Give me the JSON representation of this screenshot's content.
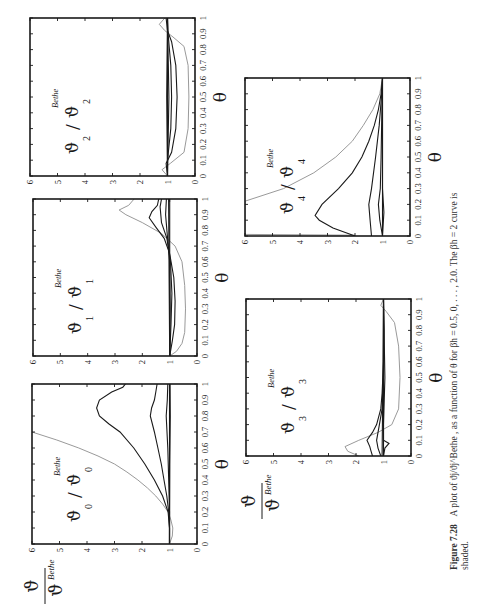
{
  "figure": {
    "number_label": "Figure 7.28",
    "caption_text": "A plot of ϑj/ϑj^Bethe , as a function of θ for βh = 0.5, 0, . . . , 2.0. The βh = 2 curve is",
    "caption_line2": "shaded.",
    "rotation": "page rotated 90° counter-clockwise",
    "shared_ylabel_numerator": "ϑ",
    "shared_ylabel_denominator": "ϑ",
    "shared_ylabel_sup": "Bethe"
  },
  "chart_data": [
    {
      "type": "line",
      "id": "plot0",
      "title": "ϑ0/ϑ0^Bethe",
      "inset_label": {
        "main": "ϑ",
        "sub": "0",
        "slash": "/",
        "main2": "ϑ",
        "sub2": "0",
        "sup": "Bethe"
      },
      "xlabel": "θ",
      "ylabel": "ϑ/ϑ^Bethe",
      "xlim": [
        0,
        1
      ],
      "ylim": [
        0,
        6
      ],
      "xticks": [
        "0",
        "0.1",
        "0.2",
        "0.3",
        "0.4",
        "0.5",
        "0.6",
        "0.7",
        "0.8",
        "0.9",
        "1"
      ],
      "yticks": [
        "0",
        "1",
        "2",
        "3",
        "4",
        "5",
        "6"
      ],
      "frame_px": {
        "x0": 32,
        "x1": 197,
        "y0": 384,
        "y1": 544
      },
      "series": [
        {
          "name": "βh=2.0 (shaded)",
          "shaded": true,
          "x": [
            0,
            0.05,
            0.1,
            0.15,
            0.2,
            0.25,
            0.3,
            0.35,
            0.4,
            0.45,
            0.5,
            0.55,
            0.6,
            0.65,
            0.7
          ],
          "values": [
            1.0,
            0.9,
            0.88,
            0.95,
            1.05,
            1.25,
            1.5,
            1.8,
            2.15,
            2.55,
            3.0,
            3.6,
            4.3,
            5.1,
            6.0
          ]
        },
        {
          "name": "βh=1.5",
          "x": [
            0,
            0.1,
            0.2,
            0.3,
            0.4,
            0.5,
            0.6,
            0.7,
            0.75,
            0.8,
            0.85,
            0.9,
            0.95,
            0.98,
            1.0
          ],
          "values": [
            1.0,
            1.0,
            1.05,
            1.25,
            1.55,
            1.9,
            2.3,
            2.8,
            3.2,
            3.55,
            3.65,
            3.55,
            3.1,
            2.7,
            2.6
          ]
        },
        {
          "name": "βh=1.0",
          "x": [
            0,
            0.1,
            0.2,
            0.3,
            0.4,
            0.5,
            0.6,
            0.7,
            0.8,
            0.85,
            0.9,
            0.95,
            1.0
          ],
          "values": [
            1.0,
            1.0,
            1.03,
            1.1,
            1.2,
            1.3,
            1.42,
            1.55,
            1.7,
            1.65,
            1.55,
            1.5,
            1.45
          ]
        },
        {
          "name": "βh=0.5",
          "x": [
            0,
            0.2,
            0.4,
            0.6,
            0.8,
            0.9,
            1.0
          ],
          "values": [
            1.0,
            1.0,
            1.03,
            1.06,
            1.12,
            1.08,
            1.06
          ]
        },
        {
          "name": "βh=0",
          "x": [
            0,
            0.5,
            1.0
          ],
          "values": [
            1.0,
            1.0,
            1.0
          ]
        },
        {
          "name": "βh=-0.5",
          "x": [
            0,
            0.5,
            0.8,
            1.0
          ],
          "values": [
            1.0,
            0.99,
            0.97,
            0.98
          ]
        }
      ]
    },
    {
      "type": "line",
      "id": "plot1",
      "title": "ϑ1/ϑ1^Bethe",
      "inset_label": {
        "main": "ϑ",
        "sub": "1",
        "slash": "/",
        "main2": "ϑ",
        "sub2": "1",
        "sup": "Bethe"
      },
      "xlabel": "θ",
      "xlim": [
        0,
        1
      ],
      "ylim": [
        0,
        6
      ],
      "xticks": [
        "0",
        "0.1",
        "0.2",
        "0.3",
        "0.4",
        "0.5",
        "0.6",
        "0.7",
        "0.8",
        "0.9",
        "1"
      ],
      "yticks": [
        "0",
        "1",
        "2",
        "3",
        "4",
        "5",
        "6"
      ],
      "frame_px": {
        "x0": 33,
        "x1": 197,
        "y0": 199,
        "y1": 356
      },
      "series": [
        {
          "name": "βh=2.0 (shaded)",
          "shaded": true,
          "x": [
            0,
            0.03,
            0.08,
            0.15,
            0.3,
            0.45,
            0.6,
            0.7,
            0.78,
            0.85,
            0.9,
            0.93,
            0.96,
            1.0
          ],
          "values": [
            1.0,
            0.75,
            0.55,
            0.45,
            0.42,
            0.45,
            0.55,
            0.8,
            1.3,
            2.0,
            2.6,
            2.85,
            2.5,
            2.3
          ]
        },
        {
          "name": "βh=1.5",
          "x": [
            0,
            0.1,
            0.2,
            0.35,
            0.5,
            0.65,
            0.75,
            0.82,
            0.88,
            0.92,
            0.96,
            1.0
          ],
          "values": [
            1.0,
            0.9,
            0.82,
            0.8,
            0.85,
            1.0,
            1.2,
            1.5,
            1.75,
            1.65,
            1.45,
            1.4
          ]
        },
        {
          "name": "βh=1.0",
          "x": [
            0,
            0.2,
            0.4,
            0.6,
            0.75,
            0.85,
            0.95,
            1.0
          ],
          "values": [
            1.0,
            0.95,
            0.92,
            0.97,
            1.1,
            1.3,
            1.35,
            1.3
          ]
        },
        {
          "name": "βh=0.5",
          "x": [
            0,
            0.3,
            0.6,
            0.8,
            0.9,
            1.0
          ],
          "values": [
            1.0,
            0.98,
            1.0,
            1.1,
            1.15,
            1.12
          ]
        },
        {
          "name": "βh=0",
          "x": [
            0,
            0.5,
            1.0
          ],
          "values": [
            1.0,
            1.0,
            1.0
          ]
        },
        {
          "name": "βh=-0.5",
          "x": [
            0,
            0.5,
            1.0
          ],
          "values": [
            1.0,
            1.02,
            1.04
          ]
        }
      ]
    },
    {
      "type": "line",
      "id": "plot2",
      "title": "ϑ2/ϑ2^Bethe",
      "inset_label": {
        "main": "ϑ",
        "sub": "2",
        "slash": "/",
        "main2": "ϑ",
        "sub2": "2",
        "sup": "Bethe"
      },
      "xlabel": "θ",
      "xlim": [
        0,
        1
      ],
      "ylim": [
        0,
        6
      ],
      "xticks": [
        "0",
        "0.1",
        "0.2",
        "0.3",
        "0.4",
        "0.5",
        "0.6",
        "0.7",
        "0.8",
        "0.9",
        "1"
      ],
      "yticks": [
        "0",
        "1",
        "2",
        "3",
        "4",
        "5",
        "6"
      ],
      "frame_px": {
        "x0": 30,
        "x1": 195,
        "y0": 18,
        "y1": 176
      },
      "series": [
        {
          "name": "βh=2.0 (shaded)",
          "shaded": true,
          "x": [
            0,
            0.04,
            0.08,
            0.15,
            0.3,
            0.5,
            0.7,
            0.82,
            0.88,
            0.92,
            0.96,
            1.0
          ],
          "values": [
            1.0,
            1.2,
            0.9,
            0.4,
            0.25,
            0.22,
            0.25,
            0.4,
            0.8,
            1.1,
            1.3,
            1.1
          ]
        },
        {
          "name": "βh=1.5",
          "x": [
            0,
            0.08,
            0.15,
            0.3,
            0.5,
            0.7,
            0.85,
            0.92,
            1.0
          ],
          "values": [
            1.0,
            1.05,
            0.85,
            0.7,
            0.65,
            0.7,
            0.85,
            1.0,
            1.05
          ]
        },
        {
          "name": "βh=1.0",
          "x": [
            0,
            0.1,
            0.3,
            0.5,
            0.7,
            0.9,
            1.0
          ],
          "values": [
            1.0,
            1.0,
            0.88,
            0.85,
            0.88,
            0.98,
            1.0
          ]
        },
        {
          "name": "βh=0.5",
          "x": [
            0,
            0.5,
            1.0
          ],
          "values": [
            1.0,
            0.95,
            1.0
          ]
        },
        {
          "name": "βh=0",
          "x": [
            0,
            0.5,
            1.0
          ],
          "values": [
            1.0,
            1.0,
            1.0
          ]
        },
        {
          "name": "βh=-0.5",
          "x": [
            0,
            0.5,
            1.0
          ],
          "values": [
            1.0,
            1.03,
            1.0
          ]
        }
      ]
    },
    {
      "type": "line",
      "id": "plot3",
      "title": "ϑ3/ϑ3^Bethe",
      "inset_label": {
        "main": "ϑ",
        "sub": "3",
        "slash": "/",
        "main2": "ϑ",
        "sub2": "3",
        "sup": "Bethe"
      },
      "xlabel": "θ",
      "ylabel": "ϑ/ϑ^Bethe",
      "xlim": [
        0,
        1
      ],
      "ylim": [
        0,
        6
      ],
      "xticks": [
        "0",
        "0.1",
        "0.2",
        "0.3",
        "0.4",
        "0.5",
        "0.6",
        "0.7",
        "0.8",
        "0.9",
        "1"
      ],
      "yticks": [
        "0",
        "1",
        "2",
        "3",
        "4",
        "5",
        "6"
      ],
      "frame_px": {
        "x0": 246,
        "x1": 411,
        "y0": 299,
        "y1": 456
      },
      "series": [
        {
          "name": "βh=2.0 (shaded)",
          "shaded": true,
          "x": [
            0,
            0.03,
            0.06,
            0.1,
            0.15,
            0.2,
            0.3,
            0.5,
            0.7,
            0.85,
            0.92,
            0.96,
            1.0
          ],
          "values": [
            1.9,
            2.3,
            2.4,
            1.9,
            1.2,
            0.7,
            0.45,
            0.4,
            0.45,
            0.6,
            0.9,
            1.1,
            1.0
          ]
        },
        {
          "name": "βh=1.5",
          "x": [
            0,
            0.03,
            0.06,
            0.1,
            0.15,
            0.2,
            0.3,
            0.4,
            0.6,
            0.8,
            1.0
          ],
          "values": [
            1.4,
            1.45,
            1.5,
            1.6,
            1.4,
            1.25,
            1.1,
            1.05,
            1.0,
            1.0,
            1.0
          ]
        },
        {
          "name": "βh=1.0",
          "x": [
            0,
            0.05,
            0.1,
            0.2,
            0.3,
            0.5,
            0.8,
            1.0
          ],
          "values": [
            1.1,
            1.2,
            1.25,
            1.15,
            1.05,
            1.0,
            0.98,
            1.0
          ]
        },
        {
          "name": "βh=0.5",
          "x": [
            0,
            0.05,
            0.08,
            0.1,
            0.2,
            0.5,
            1.0
          ],
          "values": [
            1.0,
            0.95,
            0.8,
            1.0,
            1.0,
            0.95,
            1.0
          ]
        },
        {
          "name": "βh=0",
          "x": [
            0,
            0.5,
            1.0
          ],
          "values": [
            1.0,
            1.0,
            1.0
          ]
        },
        {
          "name": "βh=-0.5",
          "x": [
            0,
            0.5,
            1.0
          ],
          "values": [
            1.05,
            1.02,
            1.0
          ]
        }
      ]
    },
    {
      "type": "line",
      "id": "plot4",
      "title": "ϑ4/ϑ4^Bethe",
      "inset_label": {
        "main": "ϑ",
        "sub": "4",
        "slash": "/",
        "main2": "ϑ",
        "sub2": "4",
        "sup": "Bethe"
      },
      "xlabel": "θ",
      "xlim": [
        0,
        1
      ],
      "ylim": [
        0,
        6
      ],
      "xticks": [
        "0",
        "0.1",
        "0.2",
        "0.3",
        "0.4",
        "0.5",
        "0.6",
        "0.7",
        "0.8",
        "0.9",
        "1"
      ],
      "yticks": [
        "0",
        "1",
        "2",
        "3",
        "4",
        "5",
        "6"
      ],
      "frame_px": {
        "x0": 245,
        "x1": 410,
        "y0": 78,
        "y1": 236
      },
      "series": [
        {
          "name": "βh=2.0 (shaded)",
          "shaded": true,
          "x": [
            0.005,
            0.01,
            0.22,
            0.3,
            0.4,
            0.5,
            0.6,
            0.7,
            0.8,
            0.9,
            1.0
          ],
          "values": [
            2.0,
            6.0,
            6.0,
            4.6,
            3.5,
            2.7,
            2.1,
            1.7,
            1.35,
            1.1,
            1.0
          ]
        },
        {
          "name": "βh=1.5",
          "x": [
            0,
            0.05,
            0.1,
            0.13,
            0.2,
            0.3,
            0.4,
            0.5,
            0.6,
            0.7,
            0.8,
            0.9,
            1.0
          ],
          "values": [
            2.0,
            2.8,
            3.3,
            3.45,
            3.2,
            2.6,
            2.1,
            1.75,
            1.5,
            1.3,
            1.15,
            1.05,
            1.0
          ]
        },
        {
          "name": "βh=1.0",
          "x": [
            0,
            0.1,
            0.2,
            0.3,
            0.5,
            0.7,
            0.9,
            1.0
          ],
          "values": [
            1.4,
            1.45,
            1.5,
            1.4,
            1.25,
            1.12,
            1.03,
            1.0
          ]
        },
        {
          "name": "βh=0.5",
          "x": [
            0,
            0.1,
            0.2,
            0.3,
            0.5,
            0.8,
            1.0
          ],
          "values": [
            1.0,
            1.1,
            1.15,
            1.08,
            1.05,
            1.02,
            1.0
          ]
        },
        {
          "name": "βh=0",
          "x": [
            0,
            0.5,
            1.0
          ],
          "values": [
            1.0,
            1.0,
            1.0
          ]
        },
        {
          "name": "βh=-0.5",
          "x": [
            0,
            0.15,
            0.3,
            1.0
          ],
          "values": [
            1.0,
            0.95,
            1.0,
            1.0
          ]
        }
      ]
    }
  ]
}
